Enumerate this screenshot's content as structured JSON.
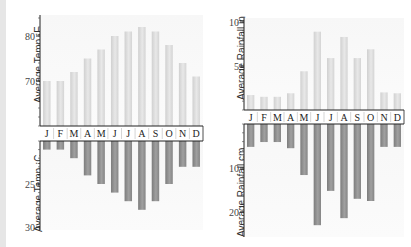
{
  "chart_data": [
    {
      "type": "bar",
      "title": "",
      "ylabel": "Average Temp ¡F",
      "xlabel": "",
      "categories": [
        "J",
        "F",
        "M",
        "A",
        "M",
        "J",
        "J",
        "A",
        "S",
        "O",
        "N",
        "D"
      ],
      "values": [
        70,
        70,
        72,
        75,
        77,
        80,
        81,
        82,
        81,
        78,
        74,
        71
      ],
      "yticks": [
        70,
        80
      ],
      "ylim": [
        60,
        85
      ],
      "position": "top-left",
      "bar_color": "#d9d9d9"
    },
    {
      "type": "bar",
      "title": "",
      "ylabel": "Average Temp ¡C",
      "xlabel": "",
      "categories": [
        "J",
        "F",
        "M",
        "A",
        "M",
        "J",
        "J",
        "A",
        "S",
        "O",
        "N",
        "D"
      ],
      "values": [
        21,
        21,
        22,
        24,
        25,
        26,
        27,
        28,
        27,
        25,
        23,
        23
      ],
      "yticks": [
        25,
        30
      ],
      "ylim": [
        20,
        30
      ],
      "inverted": true,
      "position": "bottom-left",
      "bar_color": "#8c8c8c"
    },
    {
      "type": "bar",
      "title": "",
      "ylabel": "Average Rainfall in",
      "xlabel": "",
      "categories": [
        "J",
        "F",
        "M",
        "A",
        "M",
        "J",
        "J",
        "A",
        "S",
        "O",
        "N",
        "D"
      ],
      "values": [
        1.7,
        1.5,
        1.5,
        1.9,
        4.4,
        8.9,
        5.9,
        8.3,
        5.9,
        6.9,
        2.0,
        1.9
      ],
      "yticks": [
        5,
        10
      ],
      "ylim": [
        0,
        10.5
      ],
      "position": "top-right",
      "bar_color": "#d9d9d9"
    },
    {
      "type": "bar",
      "title": "",
      "ylabel": "Average Rainfall cm",
      "xlabel": "",
      "categories": [
        "J",
        "F",
        "M",
        "A",
        "M",
        "J",
        "J",
        "A",
        "S",
        "O",
        "N",
        "D"
      ],
      "values": [
        5.2,
        4.1,
        4.1,
        5.5,
        11.6,
        23,
        15.2,
        21.4,
        17.0,
        17.5,
        5.2,
        5.2
      ],
      "yticks": [
        10,
        20
      ],
      "ylim": [
        0,
        26
      ],
      "inverted": true,
      "position": "bottom-right",
      "bar_color": "#8c8c8c"
    }
  ],
  "labels": {
    "tempF": "Average Temp ¡F",
    "tempC": "Average Temp ¡C",
    "rainIn": "Average Rainfall in",
    "rainCm": "Average Rainfall cm"
  },
  "months": [
    "J",
    "F",
    "M",
    "A",
    "M",
    "J",
    "J",
    "A",
    "S",
    "O",
    "N",
    "D"
  ]
}
